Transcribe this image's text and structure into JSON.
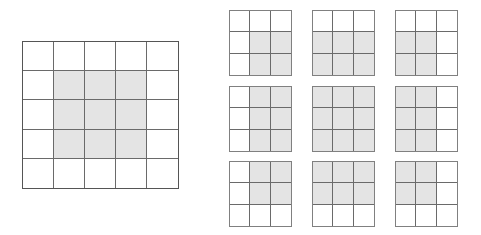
{
  "figure": {
    "colors": {
      "shaded_fill": "#e4e4e4",
      "unshaded_fill": "#ffffff",
      "inner_line": "#6a6a6a",
      "outer_border_large": "#555555",
      "outer_border_small": "#808080",
      "background": "#ffffff"
    }
  },
  "source_grid": {
    "name": "source-grid",
    "rows": 5,
    "cols": 5,
    "shaded_region_label": "center 3x3",
    "cells": [
      [
        0,
        0,
        0,
        0,
        0
      ],
      [
        0,
        1,
        1,
        1,
        0
      ],
      [
        0,
        1,
        1,
        1,
        0
      ],
      [
        0,
        1,
        1,
        1,
        0
      ],
      [
        0,
        0,
        0,
        0,
        0
      ]
    ]
  },
  "window_panel": {
    "name": "window-panel",
    "layout_rows": 3,
    "layout_cols": 3,
    "grids": [
      {
        "name": "window-grid-top-left",
        "position": "top-left",
        "rows": 3,
        "cols": 3,
        "shaded_description": "bottom-right 2x2 block",
        "cells": [
          [
            0,
            0,
            0
          ],
          [
            0,
            1,
            1
          ],
          [
            0,
            1,
            1
          ]
        ]
      },
      {
        "name": "window-grid-top-center",
        "position": "top-center",
        "rows": 3,
        "cols": 3,
        "shaded_description": "bottom two rows, all columns",
        "cells": [
          [
            0,
            0,
            0
          ],
          [
            1,
            1,
            1
          ],
          [
            1,
            1,
            1
          ]
        ]
      },
      {
        "name": "window-grid-top-right",
        "position": "top-right",
        "rows": 3,
        "cols": 3,
        "shaded_description": "bottom-left 2x2 block",
        "cells": [
          [
            0,
            0,
            0
          ],
          [
            1,
            1,
            0
          ],
          [
            1,
            1,
            0
          ]
        ]
      },
      {
        "name": "window-grid-middle-left",
        "position": "middle-left",
        "rows": 3,
        "cols": 3,
        "shaded_description": "right two columns, all rows",
        "cells": [
          [
            0,
            1,
            1
          ],
          [
            0,
            1,
            1
          ],
          [
            0,
            1,
            1
          ]
        ]
      },
      {
        "name": "window-grid-middle-center",
        "position": "middle-center",
        "rows": 3,
        "cols": 3,
        "shaded_description": "all nine cells",
        "cells": [
          [
            1,
            1,
            1
          ],
          [
            1,
            1,
            1
          ],
          [
            1,
            1,
            1
          ]
        ]
      },
      {
        "name": "window-grid-middle-right",
        "position": "middle-right",
        "rows": 3,
        "cols": 3,
        "shaded_description": "left two columns, all rows",
        "cells": [
          [
            1,
            1,
            0
          ],
          [
            1,
            1,
            0
          ],
          [
            1,
            1,
            0
          ]
        ]
      },
      {
        "name": "window-grid-bottom-left",
        "position": "bottom-left",
        "rows": 3,
        "cols": 3,
        "shaded_description": "top-right 2x2 block",
        "cells": [
          [
            0,
            1,
            1
          ],
          [
            0,
            1,
            1
          ],
          [
            0,
            0,
            0
          ]
        ]
      },
      {
        "name": "window-grid-bottom-center",
        "position": "bottom-center",
        "rows": 3,
        "cols": 3,
        "shaded_description": "top two rows, all columns",
        "cells": [
          [
            1,
            1,
            1
          ],
          [
            1,
            1,
            1
          ],
          [
            0,
            0,
            0
          ]
        ]
      },
      {
        "name": "window-grid-bottom-right",
        "position": "bottom-right",
        "rows": 3,
        "cols": 3,
        "shaded_description": "top-left 2x2 block",
        "cells": [
          [
            1,
            1,
            0
          ],
          [
            1,
            1,
            0
          ],
          [
            0,
            0,
            0
          ]
        ]
      }
    ]
  }
}
